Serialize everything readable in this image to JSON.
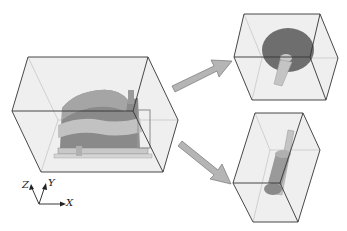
{
  "figure": {
    "colors": {
      "box_edge": "#333333",
      "box_fill": "#eeeeee",
      "part_dark": "#6e6e6e",
      "part_mid": "#8c8c8c",
      "part_light": "#bdbdbd",
      "arrow_fill": "#b5b5b5",
      "arrow_stroke": "#666666"
    },
    "boxes": [
      {
        "name": "assembly-box",
        "content": "gearbox assembly"
      },
      {
        "name": "part-box-top",
        "content": "gear wheel with shaft"
      },
      {
        "name": "part-box-bottom",
        "content": "gear shaft"
      }
    ],
    "arrows": [
      {
        "from": "assembly-box",
        "to": "part-box-top"
      },
      {
        "from": "assembly-box",
        "to": "part-box-bottom"
      }
    ]
  },
  "axes": {
    "z_label": "Z",
    "y_label": "Y",
    "x_label": "X"
  }
}
